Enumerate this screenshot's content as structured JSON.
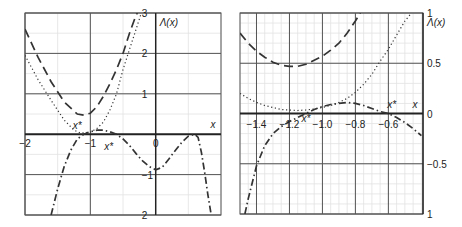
{
  "chart_data": [
    {
      "type": "line",
      "title": "",
      "xlabel": "x",
      "ylabel": "Λ(x)",
      "xlim": [
        -2,
        1
      ],
      "ylim": [
        -2,
        3
      ],
      "grid": true,
      "x_ticks": [
        {
          "v": -2,
          "t": "−2"
        },
        {
          "v": -1,
          "t": "−1"
        },
        {
          "v": 0,
          "t": "0"
        }
      ],
      "y_ticks": [
        {
          "v": 3,
          "t": "3"
        },
        {
          "v": 2,
          "t": "2"
        },
        {
          "v": 1,
          "t": "1"
        },
        {
          "v": -1,
          "t": "−1"
        },
        {
          "v": -2,
          "t": "2"
        }
      ],
      "annotations": [
        {
          "text": "x*",
          "x": -1.2,
          "y": 0.12
        },
        {
          "text": "x*",
          "x": -0.72,
          "y": -0.38
        }
      ],
      "series": [
        {
          "name": "dashed",
          "style": "dashed",
          "x": [
            -2,
            -1.8,
            -1.6,
            -1.4,
            -1.2,
            -1.1,
            -1.0,
            -0.9,
            -0.8,
            -0.7,
            -0.6,
            -0.5,
            -0.4,
            -0.3,
            -0.28
          ],
          "y": [
            2.6,
            1.9,
            1.3,
            0.8,
            0.5,
            0.47,
            0.52,
            0.68,
            0.94,
            1.25,
            1.6,
            2.0,
            2.5,
            2.95,
            3.0
          ]
        },
        {
          "name": "dotted",
          "style": "dotted",
          "x": [
            -2,
            -1.8,
            -1.6,
            -1.4,
            -1.25,
            -1.15,
            -1.0,
            -0.9,
            -0.8,
            -0.7,
            -0.6,
            -0.5,
            -0.4,
            -0.3,
            -0.22
          ],
          "y": [
            1.95,
            1.35,
            0.84,
            0.35,
            0.1,
            0.03,
            0.05,
            0.14,
            0.3,
            0.6,
            1.0,
            1.6,
            2.1,
            2.6,
            3.0
          ]
        },
        {
          "name": "dash-dot",
          "style": "dashdot",
          "x": [
            -1.6,
            -1.5,
            -1.4,
            -1.3,
            -1.2,
            -1.1,
            -1.0,
            -0.9,
            -0.8,
            -0.7,
            -0.6,
            -0.5,
            -0.4,
            -0.3,
            -0.2,
            -0.1,
            0.0,
            0.1,
            0.2,
            0.3,
            0.4,
            0.5,
            0.6,
            0.65,
            0.7,
            0.75,
            0.8,
            0.85
          ],
          "y": [
            -2.0,
            -1.35,
            -0.8,
            -0.4,
            -0.12,
            0.0,
            0.06,
            0.1,
            0.1,
            0.06,
            0.0,
            -0.12,
            -0.28,
            -0.48,
            -0.66,
            -0.8,
            -0.88,
            -0.82,
            -0.62,
            -0.4,
            -0.2,
            -0.05,
            0.0,
            -0.08,
            -0.45,
            -0.95,
            -1.5,
            -2.0
          ]
        }
      ]
    },
    {
      "type": "line",
      "title": "",
      "xlabel": "x",
      "ylabel": "Λ(x)",
      "xlim": [
        -1.5,
        -0.39
      ],
      "ylim": [
        -1,
        1
      ],
      "grid": true,
      "x_ticks": [
        {
          "v": -1.4,
          "t": "−1.4"
        },
        {
          "v": -1.2,
          "t": "−1.2"
        },
        {
          "v": -1.0,
          "t": "−1.0"
        },
        {
          "v": -0.8,
          "t": "−0.8"
        },
        {
          "v": -0.6,
          "t": "−0.6"
        }
      ],
      "y_ticks": [
        {
          "v": 1,
          "t": "1"
        },
        {
          "v": 0.5,
          "t": "0.5"
        },
        {
          "v": 0,
          "t": "0"
        },
        {
          "v": -0.5,
          "t": "−0.5"
        },
        {
          "v": -1,
          "t": "1"
        }
      ],
      "annotations": [
        {
          "text": "x*",
          "x": -1.1,
          "y": -0.08
        },
        {
          "text": "x*",
          "x": -0.58,
          "y": 0.05
        }
      ],
      "series": [
        {
          "name": "dashed",
          "style": "dashed",
          "x": [
            -1.5,
            -1.45,
            -1.4,
            -1.35,
            -1.3,
            -1.25,
            -1.2,
            -1.15,
            -1.1,
            -1.05,
            -1.0,
            -0.95,
            -0.9,
            -0.85,
            -0.8,
            -0.77
          ],
          "y": [
            0.8,
            0.7,
            0.62,
            0.56,
            0.51,
            0.48,
            0.47,
            0.47,
            0.49,
            0.53,
            0.57,
            0.63,
            0.7,
            0.8,
            0.92,
            1.0
          ]
        },
        {
          "name": "dotted",
          "style": "dotted",
          "x": [
            -1.5,
            -1.45,
            -1.4,
            -1.35,
            -1.3,
            -1.25,
            -1.2,
            -1.15,
            -1.1,
            -1.05,
            -1.0,
            -0.95,
            -0.9,
            -0.85,
            -0.8,
            -0.75,
            -0.7,
            -0.65,
            -0.6,
            -0.55,
            -0.5,
            -0.46
          ],
          "y": [
            0.2,
            0.15,
            0.11,
            0.08,
            0.06,
            0.04,
            0.035,
            0.03,
            0.035,
            0.045,
            0.06,
            0.08,
            0.11,
            0.15,
            0.21,
            0.29,
            0.39,
            0.52,
            0.64,
            0.78,
            0.92,
            1.0
          ]
        },
        {
          "name": "dash-dot",
          "style": "dashdot",
          "x": [
            -1.47,
            -1.45,
            -1.4,
            -1.35,
            -1.3,
            -1.25,
            -1.2,
            -1.15,
            -1.1,
            -1.05,
            -1.0,
            -0.95,
            -0.9,
            -0.85,
            -0.8,
            -0.75,
            -0.7,
            -0.65,
            -0.6,
            -0.55,
            -0.5,
            -0.45,
            -0.4
          ],
          "y": [
            -1.0,
            -0.85,
            -0.52,
            -0.32,
            -0.2,
            -0.13,
            -0.08,
            -0.04,
            0.0,
            0.04,
            0.07,
            0.09,
            0.1,
            0.11,
            0.1,
            0.08,
            0.05,
            0.02,
            0.0,
            -0.04,
            -0.09,
            -0.15,
            -0.22
          ]
        }
      ]
    }
  ]
}
